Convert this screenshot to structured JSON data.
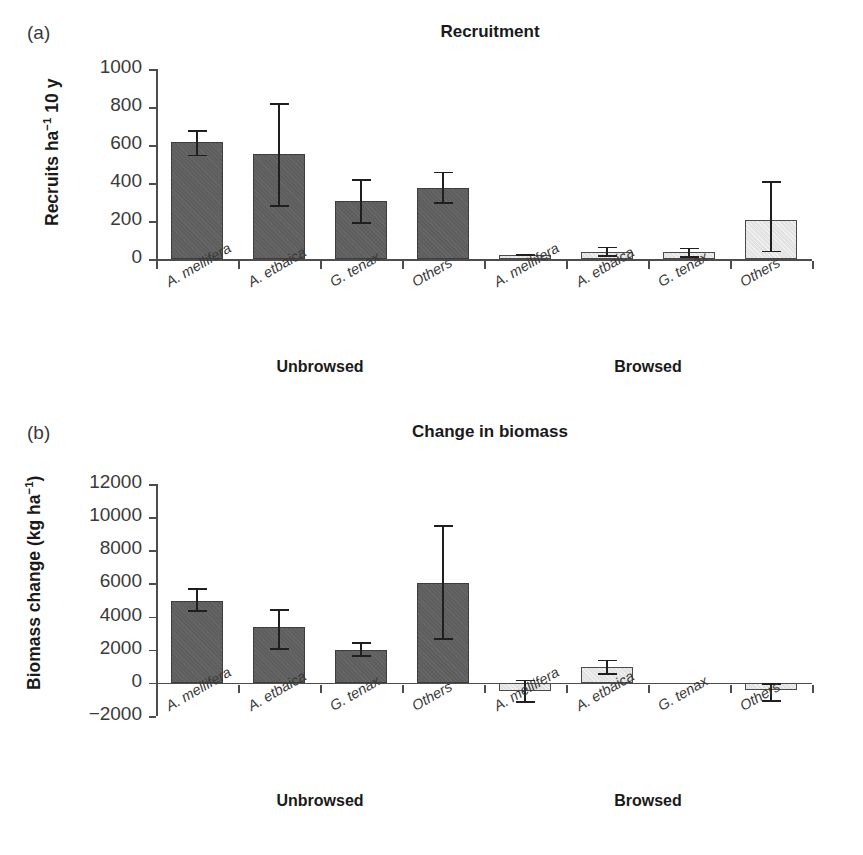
{
  "figure": {
    "panels": [
      {
        "letter": "(a)",
        "title": "Recruitment",
        "ylabel_main": "Recruits ha",
        "ylabel_sup": "−1",
        "ylabel_tail": " 10 y",
        "yticks": [
          "0",
          "200",
          "400",
          "600",
          "800",
          "1000"
        ],
        "groups": [
          {
            "label": "Unbrowsed"
          },
          {
            "label": "Browsed"
          }
        ],
        "categories": [
          "A. mellifera",
          "A. etbaica",
          "G. tenax",
          "Others",
          "A. mellifera",
          "A. etbaica",
          "G. tenax",
          "Others"
        ]
      },
      {
        "letter": "(b)",
        "title": "Change in biomass",
        "ylabel_main": "Biomass change (kg ha",
        "ylabel_sup": "−1",
        "ylabel_tail": ")",
        "yticks": [
          "−2000",
          "0",
          "2000",
          "4000",
          "6000",
          "8000",
          "10000",
          "12000"
        ],
        "groups": [
          {
            "label": "Unbrowsed"
          },
          {
            "label": "Browsed"
          }
        ],
        "categories": [
          "A. mellifera",
          "A. etbaica",
          "G. tenax",
          "Others",
          "A. mellifera",
          "A. etbaica",
          "G. tenax",
          "Others"
        ]
      }
    ]
  },
  "colors": {
    "bar_unbrowsed": "#5e5e5e",
    "bar_browsed": "#e2e2e2",
    "axis": "#4d4d4d",
    "text": "#1a1a1a"
  },
  "chart_data": [
    {
      "type": "bar",
      "panel": "(a)",
      "title": "Recruitment",
      "xlabel": "",
      "ylabel": "Recruits ha−1 10 y",
      "ylim": [
        0,
        1000
      ],
      "ytick_values": [
        0,
        200,
        400,
        600,
        800,
        1000
      ],
      "grid": false,
      "legend": "none",
      "categories": [
        "A. mellifera",
        "A. etbaica",
        "G. tenax",
        "Others",
        "A. mellifera",
        "A. etbaica",
        "G. tenax",
        "Others"
      ],
      "group_of_category": [
        "Unbrowsed",
        "Unbrowsed",
        "Unbrowsed",
        "Unbrowsed",
        "Browsed",
        "Browsed",
        "Browsed",
        "Browsed"
      ],
      "values": [
        615,
        555,
        305,
        375,
        20,
        35,
        35,
        205
      ],
      "error_upper": [
        680,
        820,
        420,
        460,
        25,
        65,
        60,
        410
      ],
      "error_lower": [
        540,
        275,
        185,
        290,
        15,
        10,
        5,
        35
      ],
      "series": [
        {
          "name": "Unbrowsed",
          "values": [
            615,
            555,
            305,
            375
          ],
          "error_upper": [
            680,
            820,
            420,
            460
          ],
          "error_lower": [
            540,
            275,
            185,
            290
          ]
        },
        {
          "name": "Browsed",
          "values": [
            20,
            35,
            35,
            205
          ],
          "error_upper": [
            25,
            65,
            60,
            410
          ],
          "error_lower": [
            15,
            10,
            5,
            35
          ]
        }
      ]
    },
    {
      "type": "bar",
      "panel": "(b)",
      "title": "Change in biomass",
      "xlabel": "",
      "ylabel": "Biomass change (kg ha−1)",
      "ylim": [
        -2000,
        12000
      ],
      "ytick_values": [
        -2000,
        0,
        2000,
        4000,
        6000,
        8000,
        10000,
        12000
      ],
      "grid": false,
      "legend": "none",
      "categories": [
        "A. mellifera",
        "A. etbaica",
        "G. tenax",
        "Others",
        "A. mellifera",
        "A. etbaica",
        "G. tenax",
        "Others"
      ],
      "group_of_category": [
        "Unbrowsed",
        "Unbrowsed",
        "Unbrowsed",
        "Unbrowsed",
        "Browsed",
        "Browsed",
        "Browsed",
        "Browsed"
      ],
      "values": [
        4950,
        3400,
        2000,
        6000,
        -500,
        950,
        0,
        -450
      ],
      "error_upper": [
        5700,
        4450,
        2450,
        9500,
        200,
        1400,
        0,
        0
      ],
      "error_lower": [
        4300,
        2000,
        1550,
        2600,
        -1200,
        500,
        0,
        -1150
      ],
      "series": [
        {
          "name": "Unbrowsed",
          "values": [
            4950,
            3400,
            2000,
            6000
          ],
          "error_upper": [
            5700,
            4450,
            2450,
            9500
          ],
          "error_lower": [
            4300,
            2000,
            1550,
            2600
          ]
        },
        {
          "name": "Browsed",
          "values": [
            -500,
            950,
            0,
            -450
          ],
          "error_upper": [
            200,
            1400,
            0,
            0
          ],
          "error_lower": [
            -1200,
            500,
            0,
            -1150
          ]
        }
      ]
    }
  ]
}
